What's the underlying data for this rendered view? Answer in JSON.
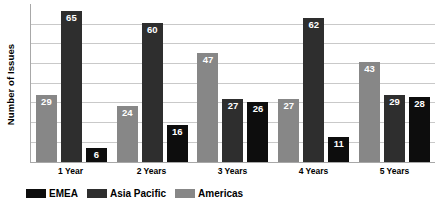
{
  "chart_data": {
    "type": "bar",
    "title": "",
    "xlabel": "",
    "ylabel": "Number of Issues",
    "categories": [
      "1 Year",
      "2 Years",
      "3 Years",
      "4 Years",
      "5 Years"
    ],
    "series": [
      {
        "name": "Americas",
        "color": "#878787",
        "values": [
          29,
          24,
          47,
          27,
          43
        ]
      },
      {
        "name": "Asia Pacific",
        "color": "#2e2e2e",
        "values": [
          65,
          60,
          27,
          62,
          29
        ]
      },
      {
        "name": "EMEA",
        "color": "#0d0d0d",
        "values": [
          6,
          16,
          26,
          11,
          28
        ]
      }
    ],
    "ylim": [
      0,
      70
    ],
    "grid": true,
    "gridline_count": 7,
    "legend_position": "bottom-left",
    "legend_order": [
      "EMEA",
      "Asia Pacific",
      "Americas"
    ],
    "y_tick_labels": [],
    "bar_value_labels": true
  },
  "axis": {
    "y_title": "Number of Issues"
  },
  "x_labels": [
    "1 Year",
    "2 Years",
    "3 Years",
    "4 Years",
    "5 Years"
  ],
  "groups": [
    {
      "category": "1 Year",
      "bars": [
        {
          "series": "Americas",
          "value": "29"
        },
        {
          "series": "Asia Pacific",
          "value": "65"
        },
        {
          "series": "EMEA",
          "value": "6"
        }
      ]
    },
    {
      "category": "2 Years",
      "bars": [
        {
          "series": "Americas",
          "value": "24"
        },
        {
          "series": "Asia Pacific",
          "value": "60"
        },
        {
          "series": "EMEA",
          "value": "16"
        }
      ]
    },
    {
      "category": "3 Years",
      "bars": [
        {
          "series": "Americas",
          "value": "47"
        },
        {
          "series": "Asia Pacific",
          "value": "27"
        },
        {
          "series": "EMEA",
          "value": "26"
        }
      ]
    },
    {
      "category": "4 Years",
      "bars": [
        {
          "series": "Americas",
          "value": "27"
        },
        {
          "series": "Asia Pacific",
          "value": "62"
        },
        {
          "series": "EMEA",
          "value": "11"
        }
      ]
    },
    {
      "category": "5 Years",
      "bars": [
        {
          "series": "Americas",
          "value": "43"
        },
        {
          "series": "Asia Pacific",
          "value": "29"
        },
        {
          "series": "EMEA",
          "value": "28"
        }
      ]
    }
  ],
  "legend": {
    "items": [
      {
        "label": "EMEA",
        "color": "#0d0d0d"
      },
      {
        "label": "Asia Pacific",
        "color": "#2e2e2e"
      },
      {
        "label": "Americas",
        "color": "#878787"
      }
    ]
  },
  "colors": {
    "americas": "#878787",
    "asia_pacific": "#2e2e2e",
    "emea": "#0d0d0d",
    "gridline": "#c9c9c9",
    "axis": "#a8a8a8",
    "background": "#ffffff"
  }
}
